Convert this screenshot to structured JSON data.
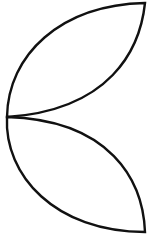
{
  "diagram": {
    "stroke_color": "#111111",
    "background": "#ffffff",
    "stroke_width": 2.4,
    "shapes": [
      {
        "name": "upper-leaf",
        "base": [
          7,
          117
        ],
        "tip": [
          145,
          3
        ]
      },
      {
        "name": "lower-leaf",
        "base": [
          7,
          117
        ],
        "tip": [
          145,
          232
        ]
      }
    ]
  }
}
